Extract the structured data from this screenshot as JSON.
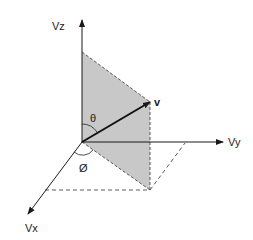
{
  "diagram": {
    "type": "3D vector coordinate diagram",
    "axes": {
      "z": {
        "label": "Vz"
      },
      "y": {
        "label": "Vy"
      },
      "x": {
        "label": "Vx"
      }
    },
    "vector": {
      "label": "v"
    },
    "angles": {
      "polar": {
        "label": "θ"
      },
      "azimuth": {
        "label": "Ø"
      }
    },
    "colors": {
      "line": "#1a1a1a",
      "plane_fill": "#c8c8c8",
      "background": "#ffffff"
    }
  }
}
